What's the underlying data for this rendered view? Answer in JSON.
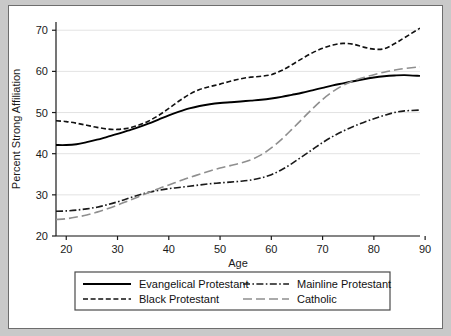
{
  "figure": {
    "background_color": "#c9c9c9",
    "panel_color": "#ffffff",
    "frame_color": "#6d6d6d",
    "grid_color": "#e3e3e3"
  },
  "chart_data": {
    "type": "line",
    "title": "",
    "subtitle": "",
    "xlabel": "Age",
    "ylabel": "Percent Strong Affiliation",
    "xlim": [
      18,
      89
    ],
    "ylim": [
      20,
      72
    ],
    "xticks": [
      20,
      30,
      40,
      50,
      60,
      70,
      80,
      90
    ],
    "xtick_labels": [
      "20",
      "30",
      "40",
      "50",
      "60",
      "70",
      "80",
      "90"
    ],
    "yticks": [
      20,
      30,
      40,
      50,
      60,
      70
    ],
    "ytick_labels": [
      "20",
      "30",
      "40",
      "50",
      "60",
      "70"
    ],
    "grid": "horizontal",
    "legend_position": "below-axes",
    "x": [
      18,
      20,
      22,
      24,
      26,
      28,
      30,
      32,
      34,
      36,
      38,
      40,
      42,
      44,
      46,
      48,
      50,
      52,
      54,
      56,
      58,
      60,
      62,
      64,
      66,
      68,
      70,
      72,
      74,
      76,
      78,
      80,
      82,
      84,
      86,
      89
    ],
    "series": [
      {
        "name": "Evangelical Protestant",
        "style": "solid",
        "color": "#000000",
        "values": [
          42.1,
          42.1,
          42.3,
          42.8,
          43.4,
          44.1,
          44.8,
          45.6,
          46.4,
          47.3,
          48.3,
          49.3,
          50.2,
          51.0,
          51.6,
          52.0,
          52.3,
          52.5,
          52.7,
          52.9,
          53.1,
          53.4,
          53.8,
          54.3,
          54.8,
          55.4,
          56.0,
          56.6,
          57.1,
          57.6,
          58.1,
          58.5,
          58.8,
          59.0,
          59.1,
          58.9
        ]
      },
      {
        "name": "Black Protestant",
        "style": "dashed",
        "color": "#111111",
        "values": [
          48.0,
          47.8,
          47.4,
          46.9,
          46.4,
          46.0,
          45.9,
          46.2,
          46.9,
          47.9,
          49.3,
          51.0,
          52.8,
          54.4,
          55.6,
          56.3,
          56.9,
          57.6,
          58.2,
          58.6,
          58.8,
          59.2,
          60.2,
          61.6,
          63.1,
          64.5,
          65.6,
          66.4,
          66.8,
          66.6,
          65.9,
          65.4,
          65.5,
          66.7,
          68.2,
          70.5
        ]
      },
      {
        "name": "Mainline Protestant",
        "style": "dashdot",
        "color": "#1a1a1a",
        "values": [
          26.0,
          26.1,
          26.3,
          26.6,
          27.0,
          27.6,
          28.3,
          29.1,
          29.9,
          30.6,
          31.1,
          31.5,
          31.8,
          32.1,
          32.4,
          32.7,
          32.9,
          33.1,
          33.3,
          33.6,
          34.1,
          34.9,
          36.1,
          37.6,
          39.3,
          41.0,
          42.7,
          44.2,
          45.5,
          46.6,
          47.6,
          48.5,
          49.3,
          50.0,
          50.4,
          50.6
        ]
      },
      {
        "name": "Catholic",
        "style": "longdash",
        "color": "#8f8f8f",
        "values": [
          24.0,
          24.2,
          24.6,
          25.1,
          25.8,
          26.6,
          27.5,
          28.5,
          29.5,
          30.5,
          31.5,
          32.4,
          33.3,
          34.2,
          35.0,
          35.8,
          36.5,
          37.1,
          37.7,
          38.5,
          39.7,
          41.4,
          43.5,
          45.9,
          48.4,
          50.9,
          53.2,
          55.1,
          56.6,
          57.7,
          58.5,
          59.2,
          59.8,
          60.3,
          60.7,
          61.1
        ]
      }
    ]
  },
  "legend": {
    "items": [
      {
        "label": "Evangelical Protestant",
        "style": "solid",
        "color": "#000000"
      },
      {
        "label": "Black Protestant",
        "style": "dashed",
        "color": "#111111"
      },
      {
        "label": "Mainline Protestant",
        "style": "dashdot",
        "color": "#1a1a1a"
      },
      {
        "label": "Catholic",
        "style": "longdash",
        "color": "#8f8f8f"
      }
    ]
  }
}
